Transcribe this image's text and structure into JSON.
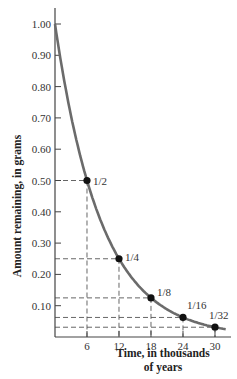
{
  "chart_data": {
    "type": "line",
    "title": "",
    "xlabel": "Time, in thousands of years",
    "xlabel_lines": [
      "Time, in thousands",
      "of years"
    ],
    "ylabel": "Amount remaining, in grams",
    "x_ticks": [
      6,
      12,
      18,
      24,
      30
    ],
    "y_ticks": [
      "0.10",
      "0.20",
      "0.30",
      "0.40",
      "0.50",
      "0.60",
      "0.70",
      "0.80",
      "0.90",
      "1.00"
    ],
    "xlim": [
      0,
      32
    ],
    "ylim": [
      0,
      1.05
    ],
    "grid": false,
    "legend": null,
    "series": [
      {
        "name": "Amount remaining (half-life decay)",
        "x": [
          0,
          6,
          12,
          18,
          24,
          30
        ],
        "y": [
          1.0,
          0.5,
          0.25,
          0.125,
          0.0625,
          0.03125
        ]
      }
    ],
    "annotations": [
      {
        "x": 6,
        "y": 0.5,
        "label": "1/2"
      },
      {
        "x": 12,
        "y": 0.25,
        "label": "1/4"
      },
      {
        "x": 18,
        "y": 0.125,
        "label": "1/8"
      },
      {
        "x": 24,
        "y": 0.0625,
        "label": "1/16"
      },
      {
        "x": 30,
        "y": 0.03125,
        "label": "1/32"
      }
    ],
    "reference_lines": "dashed lines from each marked point to both axes",
    "colors": {
      "curve": "#6b6b6b",
      "points": "#111111",
      "axes": "#444444",
      "dashes": "#555555"
    }
  }
}
